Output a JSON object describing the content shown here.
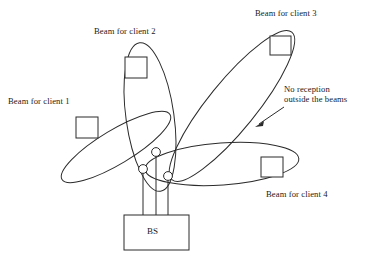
{
  "figure": {
    "type": "diagram",
    "background_color": "#ffffff",
    "line_color": "#2b2b2b",
    "width": 365,
    "height": 256
  },
  "base_station": {
    "label": "BS",
    "antenna_count": 3
  },
  "beams": [
    {
      "id": "client-1",
      "label": "Beam for client 1",
      "orientation": "upper-left"
    },
    {
      "id": "client-2",
      "label": "Beam for client 2",
      "orientation": "up"
    },
    {
      "id": "client-3",
      "label": "Beam for client 3",
      "orientation": "upper-right"
    },
    {
      "id": "client-4",
      "label": "Beam for client 4",
      "orientation": "right"
    }
  ],
  "annotation": {
    "no_reception": "No reception outside the beams",
    "no_reception_line_1": "No reception",
    "no_reception_line_2": "outside the beams"
  },
  "labels": {
    "client_1": "Beam for client 1",
    "client_2": "Beam for client 2",
    "client_3": "Beam for client 3",
    "client_4": "Beam for client 4",
    "bs": "BS"
  }
}
